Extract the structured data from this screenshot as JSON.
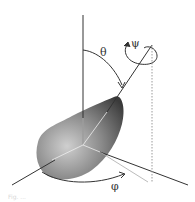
{
  "diagram": {
    "type": "euler-angles-rigid-body",
    "labels": {
      "theta": "θ",
      "psi": "ψ",
      "phi": "φ"
    },
    "elements": [
      "vertical-z-axis",
      "symmetry-axis",
      "rigid-body",
      "horizontal-axes",
      "projection-dotted-line",
      "theta-arc",
      "psi-rotation-loop",
      "phi-arc"
    ],
    "colors": {
      "axis": "#333333",
      "body_light": "#c8c8c8",
      "body_dark": "#3a3a3a",
      "dotted": "#9a9a9a",
      "inner_lines": "#e8e8e8"
    }
  },
  "caption": {
    "text": "Fig. ..."
  }
}
